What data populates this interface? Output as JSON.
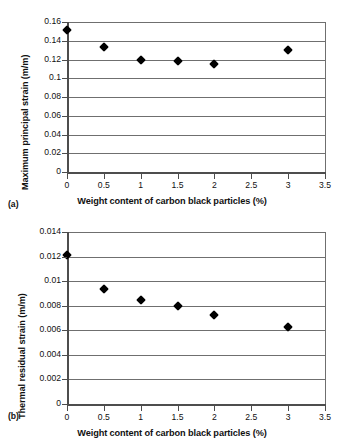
{
  "figure": {
    "background": "#ffffff",
    "marker_color": "#000000",
    "grid_color": "#6f6f6f",
    "axis_color": "#4d4d4d"
  },
  "panels": [
    {
      "tag": "(a)",
      "chart_data": {
        "type": "scatter",
        "title": "",
        "xlabel": "Weight content of carbon black particles (%)",
        "ylabel": "Maximum principal strain (m/m)",
        "xlim": [
          0,
          3.5
        ],
        "ylim": [
          0,
          0.16
        ],
        "grid": true,
        "grid_axis": "y",
        "legend": false,
        "xticks": [
          0,
          0.5,
          1,
          1.5,
          2,
          2.5,
          3,
          3.5
        ],
        "xticklabels": [
          "0",
          "0.5",
          "1",
          "1.5",
          "2",
          "2.5",
          "3",
          "3.5"
        ],
        "yticks": [
          0,
          0.02,
          0.04,
          0.06,
          0.08,
          0.1,
          0.12,
          0.14,
          0.16
        ],
        "yticklabels": [
          "0",
          "0.02",
          "0.04",
          "0.06",
          "0.08",
          "0.1",
          "0.12",
          "0.14",
          "0.16"
        ],
        "x": [
          0,
          0.5,
          1,
          1.5,
          2,
          3
        ],
        "values": [
          0.151,
          0.1335,
          0.12,
          0.118,
          0.1148,
          0.13
        ],
        "marker": "diamond"
      }
    },
    {
      "tag": "(b)",
      "chart_data": {
        "type": "scatter",
        "title": "",
        "xlabel": "Weight content of carbon black particles (%)",
        "ylabel": "Thermal residual strain (m/m)",
        "xlim": [
          0,
          3.5
        ],
        "ylim": [
          0,
          0.014
        ],
        "grid": true,
        "grid_axis": "y",
        "legend": false,
        "xticks": [
          0,
          0.5,
          1,
          1.5,
          2,
          2.5,
          3,
          3.5
        ],
        "xticklabels": [
          "0",
          "0.5",
          "1",
          "1.5",
          "2",
          "2.5",
          "3",
          "3.5"
        ],
        "yticks": [
          0,
          0.002,
          0.004,
          0.006,
          0.008,
          0.01,
          0.012,
          0.014
        ],
        "yticklabels": [
          "0",
          "0.002",
          "0.004",
          "0.006",
          "0.008",
          "0.01",
          "0.012",
          "0.014"
        ],
        "x": [
          0,
          0.5,
          1,
          1.5,
          2,
          3
        ],
        "values": [
          0.01212,
          0.0094,
          0.00845,
          0.008,
          0.00725,
          0.00623
        ],
        "marker": "diamond"
      }
    }
  ]
}
